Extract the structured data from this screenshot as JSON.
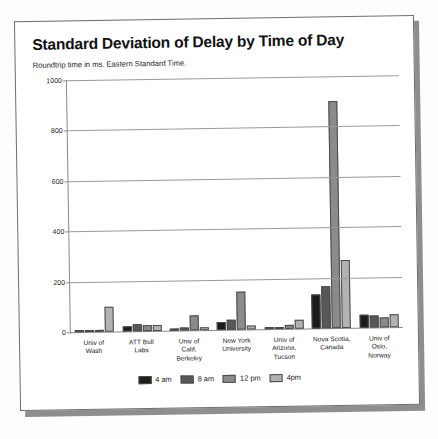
{
  "card": {
    "title": "Standard Deviation of Delay by Time of Day",
    "subtitle": "Roundtrip time in ms.  Eastern Standard Time."
  },
  "chart_data": {
    "type": "bar",
    "title": "Standard Deviation of Delay by Time of Day",
    "subtitle": "Roundtrip time in ms.  Eastern Standard Time.",
    "xlabel": "",
    "ylabel": "",
    "ylim": [
      0,
      1000
    ],
    "yticks": [
      0,
      200,
      400,
      600,
      800,
      1000
    ],
    "grid": true,
    "legend_position": "bottom",
    "categories": [
      "Univ of Wash",
      "ATT Bell Labs",
      "Univ of Calif, Berkeley",
      "New York University",
      "Univ of Arizona, Tucson",
      "Nova Scotia, Canada",
      "Univ of Oslo, Norway"
    ],
    "category_lines": [
      [
        "Univ of",
        "Wash"
      ],
      [
        "ATT Bell",
        "Labs"
      ],
      [
        "Univ of",
        "Calif,",
        "Berkeley"
      ],
      [
        "New York",
        "University"
      ],
      [
        "Univ of",
        "Arizona,",
        "Tucson"
      ],
      [
        "Nova Scotia,",
        "Canada"
      ],
      [
        "Univ of",
        "Oslo,",
        "Norway"
      ]
    ],
    "series": [
      {
        "name": "4 am",
        "color": "#1b1b1b",
        "values": [
          4,
          18,
          8,
          30,
          6,
          135,
          52
        ]
      },
      {
        "name": "8 am",
        "color": "#585858",
        "values": [
          6,
          26,
          10,
          38,
          8,
          165,
          46
        ]
      },
      {
        "name": "12 pm",
        "color": "#8b8b8b",
        "values": [
          5,
          24,
          60,
          150,
          16,
          900,
          40
        ]
      },
      {
        "name": "4pm",
        "color": "#b2b2b2",
        "values": [
          98,
          22,
          12,
          14,
          34,
          270,
          50
        ]
      }
    ]
  }
}
